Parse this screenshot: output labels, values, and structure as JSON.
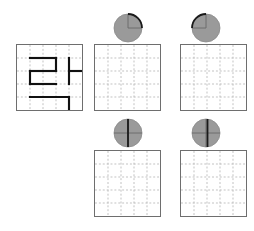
{
  "page": {
    "background_color": "#ffffff",
    "width": 254,
    "height": 231
  },
  "colors": {
    "grid_border": "#6e6e6e",
    "grid_dash": "#b9b9b9",
    "figure_stroke": "#111111",
    "marker_fill": "#9a9a9a",
    "marker_edge": "#8a8a8a",
    "marker_cross": "#6a6a6a",
    "marker_indicator": "#1a1a1a"
  },
  "grid": {
    "rows": 5,
    "cols": 5,
    "cell_size": 13.4,
    "size_px": 67,
    "dash_pattern": "2 2"
  },
  "panels": [
    {
      "id": "panel-source",
      "name": "source-grid",
      "role": "prompt",
      "x": 16,
      "y": 44,
      "has_figure": true,
      "has_marker": false,
      "marker": null,
      "label": ""
    },
    {
      "id": "panel-answer-1",
      "name": "answer-grid-1",
      "role": "answer",
      "x": 94,
      "y": 44,
      "has_figure": false,
      "has_marker": true,
      "marker": {
        "id": "marker-1",
        "name": "rotation-marker-upper-right",
        "indicator": "arc-upper-right",
        "arc_start_deg": 270,
        "arc_end_deg": 360,
        "radius": 14,
        "cx": 128,
        "cy": 28,
        "has_vertical_up": true,
        "has_vertical_down": false,
        "has_horizontal_right": true,
        "has_horizontal_left": false
      },
      "label": ""
    },
    {
      "id": "panel-answer-2",
      "name": "answer-grid-2",
      "role": "answer",
      "x": 180,
      "y": 44,
      "has_figure": false,
      "has_marker": true,
      "marker": {
        "id": "marker-2",
        "name": "rotation-marker-upper-left",
        "indicator": "arc-upper-left",
        "arc_start_deg": 180,
        "arc_end_deg": 270,
        "radius": 14,
        "cx": 206,
        "cy": 28,
        "has_vertical_up": true,
        "has_vertical_down": false,
        "has_horizontal_right": false,
        "has_horizontal_left": true
      },
      "label": ""
    },
    {
      "id": "panel-answer-3",
      "name": "answer-grid-3",
      "role": "answer",
      "x": 94,
      "y": 150,
      "has_figure": false,
      "has_marker": true,
      "marker": {
        "id": "marker-3",
        "name": "rotation-marker-vertical-right",
        "indicator": "diameter-vertical",
        "arc_start_deg": 270,
        "arc_end_deg": 90,
        "radius": 14,
        "cx": 128,
        "cy": 133,
        "has_vertical_up": true,
        "has_vertical_down": true,
        "has_horizontal_right": true,
        "has_horizontal_left": true
      },
      "label": ""
    },
    {
      "id": "panel-answer-4",
      "name": "answer-grid-4",
      "role": "answer",
      "x": 180,
      "y": 150,
      "has_figure": false,
      "has_marker": true,
      "marker": {
        "id": "marker-4",
        "name": "rotation-marker-vertical-left",
        "indicator": "diameter-vertical-offset",
        "arc_start_deg": 90,
        "arc_end_deg": 270,
        "radius": 14,
        "cx": 206,
        "cy": 133,
        "has_vertical_up": true,
        "has_vertical_down": true,
        "has_horizontal_right": true,
        "has_horizontal_left": true
      },
      "label": ""
    }
  ],
  "figure": {
    "name": "polyline-figure",
    "stroke_width": 2.2,
    "strokes": [
      {
        "name": "seg-top-horizontal",
        "x1": 1.0,
        "y1": 1.0,
        "x2": 3.0,
        "y2": 1.0
      },
      {
        "name": "seg-right-vertical-upper",
        "x1": 3.0,
        "y1": 1.0,
        "x2": 3.0,
        "y2": 2.0
      },
      {
        "name": "seg-mid-horizontal",
        "x1": 1.0,
        "y1": 2.0,
        "x2": 3.0,
        "y2": 2.0
      },
      {
        "name": "seg-left-vertical",
        "x1": 1.0,
        "y1": 2.0,
        "x2": 1.0,
        "y2": 3.0
      },
      {
        "name": "seg-lower-horizontal",
        "x1": 1.0,
        "y1": 3.0,
        "x2": 3.0,
        "y2": 3.0
      },
      {
        "name": "seg-tee-vertical",
        "x1": 4.0,
        "y1": 1.0,
        "x2": 4.0,
        "y2": 3.0
      },
      {
        "name": "seg-tee-horizontal",
        "x1": 4.0,
        "y1": 2.0,
        "x2": 5.0,
        "y2": 2.0
      },
      {
        "name": "seg-bottom-horizontal",
        "x1": 1.0,
        "y1": 4.0,
        "x2": 4.0,
        "y2": 4.0
      },
      {
        "name": "seg-bottom-vertical",
        "x1": 4.0,
        "y1": 4.0,
        "x2": 4.0,
        "y2": 5.0
      }
    ]
  }
}
